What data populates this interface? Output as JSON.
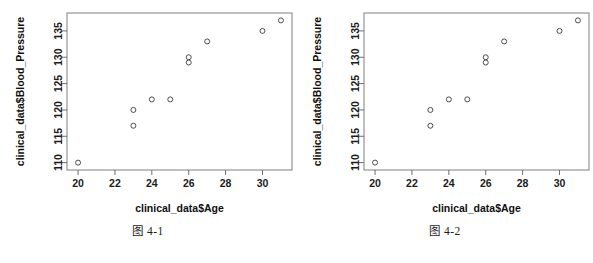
{
  "figures": [
    {
      "caption": "图 4-1",
      "chart_data": {
        "type": "scatter",
        "title": "",
        "xlabel": "clinical_data$Age",
        "ylabel": "clinical_data$Blood_Pressure",
        "xlim": [
          19.4,
          31.6
        ],
        "ylim": [
          108.6,
          138.4
        ],
        "xticks": [
          20,
          22,
          24,
          26,
          28,
          30
        ],
        "yticks": [
          110,
          115,
          120,
          125,
          130,
          135
        ],
        "xticklabels": [
          "20",
          "22",
          "24",
          "26",
          "28",
          "30"
        ],
        "yticklabels": [
          "110",
          "115",
          "120",
          "125",
          "130",
          "135"
        ],
        "grid": false,
        "legend": false,
        "marker": "open-circle",
        "points": [
          {
            "x": 20,
            "y": 110
          },
          {
            "x": 23,
            "y": 117
          },
          {
            "x": 23,
            "y": 120
          },
          {
            "x": 24,
            "y": 122
          },
          {
            "x": 25,
            "y": 122
          },
          {
            "x": 26,
            "y": 129
          },
          {
            "x": 26,
            "y": 130
          },
          {
            "x": 27,
            "y": 133
          },
          {
            "x": 30,
            "y": 135
          },
          {
            "x": 31,
            "y": 137
          }
        ]
      }
    },
    {
      "caption": "图 4-2",
      "chart_data": {
        "type": "scatter",
        "title": "",
        "xlabel": "clinical_data$Age",
        "ylabel": "clinical_data$Blood_Pressure",
        "xlim": [
          19.4,
          31.6
        ],
        "ylim": [
          108.6,
          138.4
        ],
        "xticks": [
          20,
          22,
          24,
          26,
          28,
          30
        ],
        "yticks": [
          110,
          115,
          120,
          125,
          130,
          135
        ],
        "xticklabels": [
          "20",
          "22",
          "24",
          "26",
          "28",
          "30"
        ],
        "yticklabels": [
          "110",
          "115",
          "120",
          "125",
          "130",
          "135"
        ],
        "grid": false,
        "legend": false,
        "marker": "open-circle",
        "points": [
          {
            "x": 20,
            "y": 110
          },
          {
            "x": 23,
            "y": 117
          },
          {
            "x": 23,
            "y": 120
          },
          {
            "x": 24,
            "y": 122
          },
          {
            "x": 25,
            "y": 122
          },
          {
            "x": 26,
            "y": 129
          },
          {
            "x": 26,
            "y": 130
          },
          {
            "x": 27,
            "y": 133
          },
          {
            "x": 30,
            "y": 135
          },
          {
            "x": 31,
            "y": 137
          }
        ]
      }
    }
  ]
}
